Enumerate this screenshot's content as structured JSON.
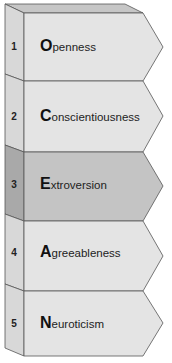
{
  "diagram": {
    "title": "",
    "rows": [
      {
        "number": "1",
        "initial": "O",
        "rest": "penness",
        "highlighted": false
      },
      {
        "number": "2",
        "initial": "C",
        "rest": "onscientiousness",
        "highlighted": false
      },
      {
        "number": "3",
        "initial": "E",
        "rest": "xtroversion",
        "highlighted": true
      },
      {
        "number": "4",
        "initial": "A",
        "rest": "greeableness",
        "highlighted": false
      },
      {
        "number": "5",
        "initial": "N",
        "rest": "euroticism",
        "highlighted": false
      }
    ],
    "colors": {
      "face": "#e4e4e4",
      "face_highlight": "#c4c4c4",
      "side": "#d6d6d6",
      "side_highlight": "#a9a9a9",
      "top": "#bdbdbd",
      "stroke": "#555555"
    }
  }
}
